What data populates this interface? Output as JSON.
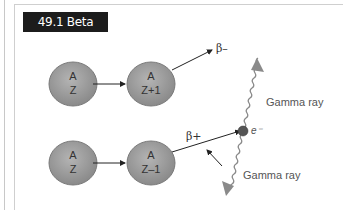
{
  "figure": {
    "title": "49.1 Beta decay",
    "rows": [
      {
        "parent": {
          "top": "A",
          "bottom": "Z"
        },
        "daughter": {
          "top": "A",
          "bottom": "Z+1"
        },
        "emitted": "β–"
      },
      {
        "parent": {
          "top": "A",
          "bottom": "Z"
        },
        "daughter": {
          "top": "A",
          "bottom": "Z–1"
        },
        "emitted": "β+"
      }
    ],
    "electron_label": "e⁻",
    "gamma_labels": [
      "Gamma ray",
      "Gamma ray"
    ],
    "colors": {
      "nucleus_fill": "#9a9a9a",
      "nucleus_stroke": "#7a7a7a",
      "electron_fill": "#555555",
      "gamma_ray": "#8a8a8a",
      "title_bg": "#1c1c1c"
    }
  }
}
